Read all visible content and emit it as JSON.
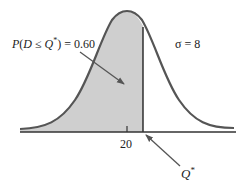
{
  "diagram": {
    "type": "normal-distribution",
    "probability_label": "P(D ≤ Q*) = 0.60",
    "probability_parts": {
      "p": "P",
      "open": "(",
      "d": "D",
      "le": " ≤ ",
      "q": "Q",
      "star": "*",
      "close": ") = 0.60"
    },
    "sigma_label": "σ = 8",
    "mean_tick_label": "20",
    "q_star_label": "Q*",
    "q_star_parts": {
      "q": "Q",
      "star": "*"
    },
    "shaded_fraction": 0.6,
    "mean": 20,
    "sigma": 8,
    "colors": {
      "curve": "#555555",
      "shade": "#cfcfcf",
      "axis": "#333333",
      "arrow": "#555555"
    }
  }
}
